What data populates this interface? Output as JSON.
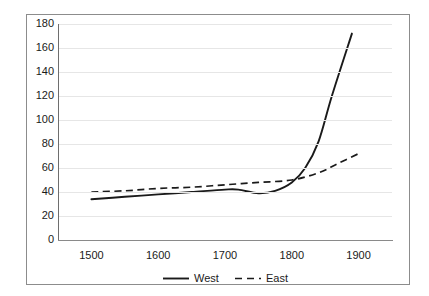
{
  "chart_data": {
    "type": "line",
    "title": "",
    "xlabel": "",
    "ylabel": "",
    "xlim": [
      1450,
      1950
    ],
    "ylim": [
      0,
      180
    ],
    "ytick_labels": [
      "180",
      "160",
      "140",
      "120",
      "100",
      "80",
      "60",
      "40",
      "20",
      "0"
    ],
    "ytick_values": [
      180,
      160,
      140,
      120,
      100,
      80,
      60,
      40,
      20,
      0
    ],
    "xtick_labels": [
      "1500",
      "1600",
      "1700",
      "1800",
      "1900"
    ],
    "xtick_values": [
      1500,
      1600,
      1700,
      1800,
      1900
    ],
    "grid": "horizontal",
    "legend_position": "bottom-center",
    "series": [
      {
        "name": "West",
        "style": "solid",
        "color": "#1a1a1a",
        "x": [
          1500,
          1550,
          1600,
          1650,
          1700,
          1720,
          1750,
          1775,
          1800,
          1820,
          1840,
          1860,
          1890
        ],
        "values": [
          34,
          36,
          38,
          40,
          42,
          42,
          39,
          41,
          48,
          60,
          82,
          120,
          172
        ]
      },
      {
        "name": "East",
        "style": "dashed",
        "color": "#1a1a1a",
        "x": [
          1500,
          1550,
          1600,
          1650,
          1700,
          1750,
          1800,
          1840,
          1870,
          1900
        ],
        "values": [
          40,
          41,
          43,
          44,
          46,
          48,
          50,
          56,
          64,
          72
        ]
      }
    ]
  },
  "legend": {
    "west_label": "West",
    "east_label": "East"
  }
}
